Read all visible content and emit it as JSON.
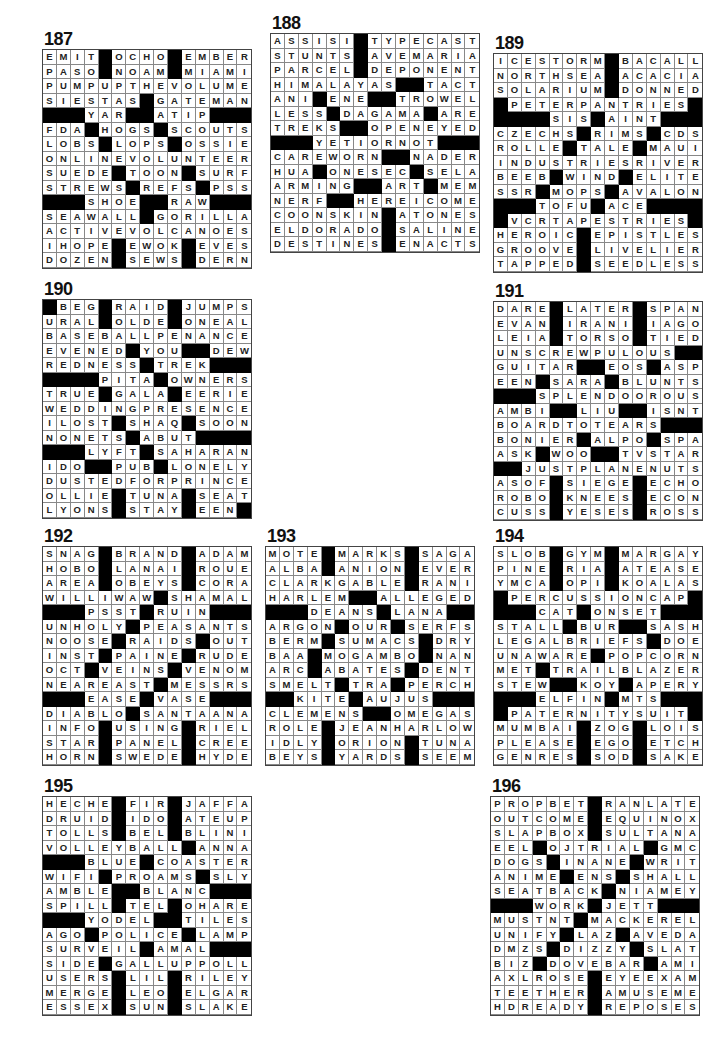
{
  "puzzles": [
    {
      "id": "187",
      "label": "187",
      "pos": {
        "left": 42,
        "top": 30
      },
      "rows": [
        "EMIT#OCHO#EMBER",
        "PASO#NOAM#MIAMI",
        "PUMPUPTHEVOLUME",
        "SIESTAS#GATEMAN",
        "###YAR##ATIP###",
        "FDA#HOGS#SCOUTS",
        "LOBS#LOPS#OSSIE",
        "ONLINEVOLUNTEER",
        "SUEDE#TOON#SURF",
        "STREWS#REFS#PSS",
        "###SHOE##RAW###",
        "SEAWALL#GORILLA",
        "ACTIVEVOLCANOES",
        "IHOPE#EWOK#EVES",
        "DOZEN#SEWS#DERN"
      ]
    },
    {
      "id": "188",
      "label": "188",
      "pos": {
        "left": 270,
        "top": 14
      },
      "rows": [
        "ASSISI#TYPECAST",
        "STUNTS#AVEMARIA",
        "PARCEL#DEPONENT",
        "HIMALAYAS##TACT",
        "ANI#ENE##TROWEL",
        "LESS#DAGAMA#ARE",
        "TREKS##OPENEYED",
        "###YETIORNOT###",
        "CAREWORN##NADER",
        "HUA#ONESEC#SELA",
        "ARMING##ART#MEM",
        "NERF##HEREICOME",
        "COONSKIN#ATONES",
        "ELDORADO#SALINE",
        "DESTINES#ENACTS"
      ]
    },
    {
      "id": "189",
      "label": "189",
      "pos": {
        "left": 493,
        "top": 34
      },
      "rows": [
        "ICESTORM#BACALL",
        "NORTHSEA#ACACIA",
        "SOLARIUM#DONNED",
        "#PETERPANTRIES#",
        "####SIS#AINT###",
        "CZECHS#RIMS#CDS",
        "ROLLE#TALE#MAUI",
        "INDUSTRIESRIVER",
        "BEEB#WIND#ELITE",
        "SSR#MOPS#AVALON",
        "###TOFU#ACE####",
        "#VCRTAPESTRIES#",
        "HEROIC#EPISTLES",
        "GROOVE#LIVELIER",
        "TAPPED#SEEDLESS"
      ]
    },
    {
      "id": "190",
      "label": "190",
      "pos": {
        "left": 42,
        "top": 280
      },
      "rows": [
        "#BEG#RAID#JUMPS",
        "URAL#OLDE#ONEAL",
        "BASEBALLPENANCE",
        "EVENED#YOU##DEW",
        "REDNESS#TREK###",
        "####PITA#OWNERS",
        "TRUE#GALA#EERIE",
        "WEDDINGPRESENCE",
        "ILOST#SHAQ#SOON",
        "NONETS#ABUT####",
        "###LYFT#SAHARAN",
        "IDO##PUB#LONELY",
        "DUSTEDFORPRINCE",
        "OLLIE#TUNA#SEAT",
        "LYONS#STAY#EEN#"
      ]
    },
    {
      "id": "191",
      "label": "191",
      "pos": {
        "left": 493,
        "top": 282
      },
      "rows": [
        "DARE#LATER#SPAN",
        "EVAN#IRANI#IAGO",
        "LEIA#TORSO#TIED",
        "UNSCREWPULOUS##",
        "GUITAR##EOS#ASP",
        "EEN#SARA#BLUNTS",
        "###SPLENDOOROUS",
        "AMBI##LIU##ISNT",
        "BOARDTOTEARS###",
        "BONIER#ALPO#SPA",
        "ASK#WOO##TVSTAR",
        "##JUSTPLANENUTS",
        "ASOF#SIEGE#ECHO",
        "ROBO#KNEES#ECON",
        "CUSS#YESES#ROSS"
      ]
    },
    {
      "id": "192",
      "label": "192",
      "pos": {
        "left": 42,
        "top": 527
      },
      "rows": [
        "SNAG#BRAND#ADAM",
        "HOBO#LANAI#ROUE",
        "AREA#OBEYS#CORA",
        "WILLIWAW#SHAMAL",
        "###PSST#RUIN###",
        "UNHOLY#PEASANTS",
        "NOOSE#RAIDS#OUT",
        "INST#PAINE#RUDE",
        "OCT#VEINS#VENOM",
        "NEAREAST#MESSRS",
        "###EASE#VASE###",
        "DIABLO#SANTAANA",
        "INFO#USING#RIEL",
        "STAR#PANEL#CREE",
        "HORN#SWEDE#HYDE"
      ]
    },
    {
      "id": "193",
      "label": "193",
      "pos": {
        "left": 265,
        "top": 527
      },
      "rows": [
        "MOTE#MARKS#SAGA",
        "ALBA#ANION#EVER",
        "CLARKGABLE#RANI",
        "HARLEM##ALLEGED",
        "###DEANS#LANA##",
        "ARGON#OUR#SERFS",
        "BERM#SUMACS#DRY",
        "BAA#MOGAMBO#NAN",
        "ARC#ABATES#DENT",
        "SMELT#TRA#PERCH",
        "##KITE#AUJUS###",
        "CLEMENS##OMEGAS",
        "ROLE#JEANHARLOW",
        "IDLY#ORION#TUNA",
        "BEYS#YARDS#SEEM"
      ]
    },
    {
      "id": "194",
      "label": "194",
      "pos": {
        "left": 493,
        "top": 527
      },
      "rows": [
        "SLOB#GYM#MARGAY",
        "PINE#RIA#ATEASE",
        "YMCA#OPI#KOALAS",
        "#PERCUSSIONCAP#",
        "###CAT#ONSET###",
        "STALL#BUR##SASH",
        "LEGALBRIEFS#DOE",
        "UNAWARE#POPCORN",
        "MET#TRAILBLAZER",
        "STEW##KOY#APERY",
        "###ELFIN#MTS###",
        "#PATERNITYSUIT#",
        "MUMBAI#ZOG#LOIS",
        "PLEASE#EGO#ETCH",
        "GENRES#SOD#SAKE"
      ]
    },
    {
      "id": "195",
      "label": "195",
      "pos": {
        "left": 42,
        "top": 777
      },
      "rows": [
        "HECHE#FIR#JAFFA",
        "DRUID#IDO#ATEUP",
        "TOLLS#BEL#BLINI",
        "VOLLEYBALL#ANNA",
        "###BLUE#COASTER",
        "WIFI#PROAMS#SLY",
        "AMBLE##BLANC###",
        "SPILL#TEL#OHARE",
        "###YODEL##TILES",
        "AGO#POLICE#LAMP",
        "SURVEIL#AMAL###",
        "SIDE#GALLUPPOLL",
        "USERS#LIL#RILEY",
        "MERGE#LEO#ELGAR",
        "ESSEX#SUN#SLAKE"
      ]
    },
    {
      "id": "196",
      "label": "196",
      "pos": {
        "left": 490,
        "top": 777
      },
      "rows": [
        "PROPBET#RANLATE",
        "OUTCOME#EQUINOX",
        "SLAPBOX#SULTANA",
        "EEL#OJTRIAL#GMC",
        "DOGS#INANE#WRIT",
        "ANIME#ENS#SHALL",
        "SEATBACK#NIAMEY",
        "###WORK#JETT###",
        "MUSTNT#MACKEREL",
        "UNIFY#LAZ#AVEDA",
        "DMZS#DIZZY#SLAT",
        "BIZ#DOVEBAR#AMI",
        "AXLROSE#EYEEXAM",
        "TEETHER#AMUSEME",
        "HDREADY#REPOSES"
      ]
    }
  ]
}
